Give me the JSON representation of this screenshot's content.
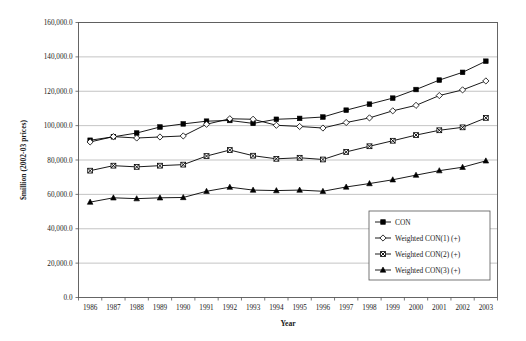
{
  "chart_data": {
    "type": "line",
    "title": "",
    "xlabel": "Year",
    "ylabel": "$million (2002-03 prices)",
    "ylim": [
      0,
      160000
    ],
    "ytick_step": 20000,
    "ytick_labels": [
      "0.0",
      "20,000.0",
      "40,000.0",
      "60,000.0",
      "80,000.0",
      "100,000.0",
      "120,000.0",
      "140,000.0",
      "160,000.0"
    ],
    "ytick_values": [
      0,
      20000,
      40000,
      60000,
      80000,
      100000,
      120000,
      140000,
      160000
    ],
    "grid": true,
    "legend_position": "inside-bottom-right",
    "categories": [
      1986,
      1987,
      1988,
      1989,
      1990,
      1991,
      1992,
      1993,
      1994,
      1995,
      1996,
      1997,
      1998,
      1999,
      2000,
      2001,
      2002,
      2003
    ],
    "xtick_labels": [
      "1986",
      "1987",
      "1988",
      "1989",
      "1990",
      "1991",
      "1992",
      "1993",
      "1994",
      "1995",
      "1996",
      "1997",
      "1998",
      "1999",
      "2000",
      "2001",
      "2002",
      "2003"
    ],
    "series": [
      {
        "name": "CON",
        "marker": "filled-square",
        "values": [
          91500,
          93500,
          95700,
          99200,
          101000,
          102600,
          103000,
          101300,
          103700,
          104200,
          105000,
          109000,
          112500,
          116000,
          121000,
          126500,
          131000,
          137500
        ]
      },
      {
        "name": "Weighted CON(1) (+)",
        "marker": "open-diamond",
        "values": [
          90500,
          93600,
          92800,
          93400,
          94000,
          100800,
          104000,
          103700,
          100200,
          99500,
          98600,
          101800,
          104500,
          108600,
          111800,
          117500,
          120800,
          126000
        ]
      },
      {
        "name": "Weighted CON(2) (+)",
        "marker": "cross-square",
        "values": [
          73800,
          76700,
          76000,
          76700,
          77300,
          82300,
          85800,
          82500,
          80700,
          81300,
          80300,
          84700,
          88000,
          91200,
          94500,
          97300,
          99000,
          104500
        ]
      },
      {
        "name": "Weighted CON(3) (+)",
        "marker": "filled-triangle",
        "values": [
          55500,
          58000,
          57500,
          58000,
          58200,
          61800,
          64200,
          62500,
          62200,
          62500,
          61800,
          64300,
          66300,
          68500,
          71200,
          73800,
          75800,
          79500
        ]
      }
    ]
  },
  "legend": {
    "entries": [
      {
        "label": "CON"
      },
      {
        "label": "Weighted CON(1) (+)"
      },
      {
        "label": "Weighted CON(2) (+)"
      },
      {
        "label": "Weighted CON(3) (+)"
      }
    ]
  },
  "colors": {
    "line": "#000000",
    "grid": "#aaaaaa",
    "axis": "#555555",
    "background": "#ffffff"
  }
}
